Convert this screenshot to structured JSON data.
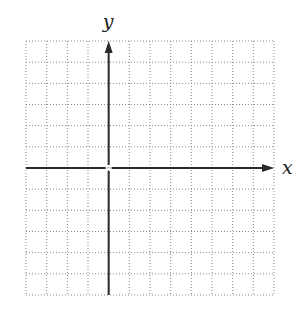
{
  "diagram": {
    "type": "coordinate-grid",
    "x_axis_label": "x",
    "y_axis_label": "y",
    "grid": {
      "columns": 12,
      "rows": 12,
      "left": 26,
      "top": 41,
      "right": 274,
      "bottom": 295,
      "line_style": "dotted",
      "line_color": "#8a8a8a"
    },
    "origin_column": 4,
    "origin_row": 6,
    "axis_color": "#2a2a2a"
  }
}
